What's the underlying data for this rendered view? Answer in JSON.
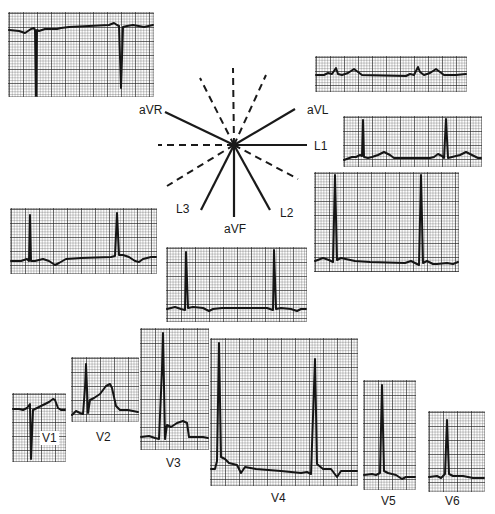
{
  "figure": {
    "axis_diagram": {
      "labels": {
        "avr": "aVR",
        "avl": "aVL",
        "l1": "L1",
        "l2": "L2",
        "l3": "L3",
        "avf": "aVF"
      },
      "solid_axes_deg": {
        "L1": 0,
        "L2": 60,
        "aVF": 90,
        "L3": 120,
        "aVR": -150,
        "aVL": -30
      },
      "dashed_axes": "negative poles of the six limb leads"
    },
    "limb_leads": [
      {
        "id": "avr",
        "label": "aVR",
        "morphology": "negative QRS complexes"
      },
      {
        "id": "avl",
        "label": "aVL",
        "morphology": "low-voltage complexes"
      },
      {
        "id": "l1",
        "label": "L1",
        "morphology": "positive QRS"
      },
      {
        "id": "l2",
        "label": "L2",
        "morphology": "tall positive QRS"
      },
      {
        "id": "l3",
        "label": "L3",
        "morphology": "positive QRS, inverted T"
      },
      {
        "id": "avf",
        "label": "aVF",
        "morphology": "positive QRS"
      }
    ],
    "precordial_leads": [
      {
        "id": "v1",
        "label": "V1"
      },
      {
        "id": "v2",
        "label": "V2"
      },
      {
        "id": "v3",
        "label": "V3"
      },
      {
        "id": "v4",
        "label": "V4"
      },
      {
        "id": "v5",
        "label": "V5"
      },
      {
        "id": "v6",
        "label": "V6"
      }
    ]
  }
}
